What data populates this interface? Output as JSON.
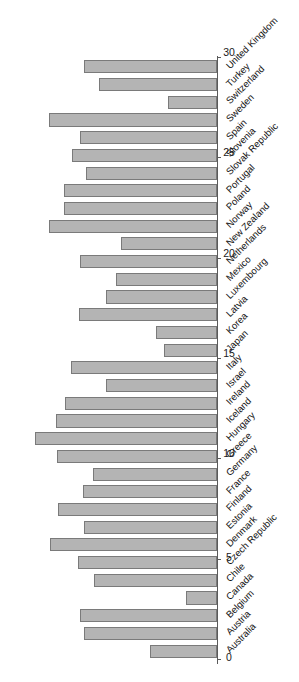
{
  "chart_data": {
    "type": "bar",
    "orientation": "horizontal-rotated",
    "title": "",
    "subtitle": "",
    "xlabel": "",
    "ylabel": "",
    "grid": false,
    "legend": null,
    "legend_position": "none",
    "axis_range": [
      0,
      30
    ],
    "tick_labels": [
      "0",
      "5",
      "10",
      "15",
      "20",
      "25",
      "30"
    ],
    "tick_values": [
      0,
      5,
      10,
      15,
      20,
      25,
      30
    ],
    "categories": [
      "Australia",
      "Austria",
      "Belgium",
      "Canada",
      "Chile",
      "Czech Republic",
      "Denmark",
      "Estonia",
      "Finland",
      "France",
      "Germany",
      "Greece",
      "Hungary",
      "Iceland",
      "Ireland",
      "Israel",
      "Italy",
      "Japan",
      "Korea",
      "Latvia",
      "Luxembourg",
      "Mexico",
      "Netherlands",
      "New Zealand",
      "Norway",
      "Poland",
      "Portugal",
      "Slovak Republic",
      "Slovenia",
      "Spain",
      "Sweden",
      "Switzerland",
      "Turkey",
      "United Kingdom"
    ],
    "values": [
      9.8,
      19.4,
      20.0,
      4.6,
      18.0,
      20.4,
      24.4,
      19.4,
      23.2,
      19.6,
      18.2,
      23.4,
      26.6,
      23.6,
      22.2,
      16.2,
      21.4,
      7.8,
      9.0,
      20.2,
      16.2,
      14.8,
      20.0,
      14.0,
      24.6,
      22.4,
      22.4,
      19.2,
      21.2,
      20.0,
      24.6,
      7.2,
      17.2,
      19.4
    ]
  },
  "axis": {
    "value_axis_name": "value-axis",
    "category_axis_name": "category-axis"
  }
}
